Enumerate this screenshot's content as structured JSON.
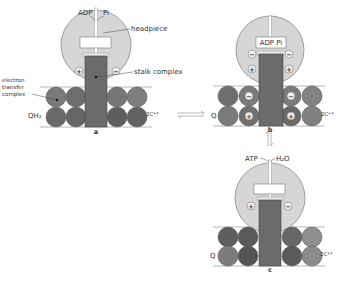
{
  "colors": {
    "headpiece": "#d6d6d6",
    "stalk": "#6b6b6b",
    "sphere_dark": "#5e5e5e",
    "sphere_mid": "#7a7a7a",
    "sphere_light": "#9a9a9a",
    "line": "#9a9a9a"
  },
  "panels": {
    "a": {
      "letter": "a",
      "top_left": "ADP",
      "top_right": "Pi",
      "headpiece_label": "headpiece",
      "stalk_label": "stalk complex",
      "etc_label": "electron transfer complex",
      "etc_lines": [
        "electron",
        "transfer",
        "complex"
      ],
      "left_label": "QH₂",
      "right_label": "2C⁺³",
      "head_signs": [
        "+",
        "−"
      ]
    },
    "b": {
      "letter": "b",
      "box_label": "ADP  Pi",
      "left_label": "Q",
      "right_label": "2C⁺³",
      "head_signs": [
        "−",
        "−",
        "+",
        "+"
      ],
      "sphere_signs": [
        "−",
        "−",
        "+",
        "+"
      ]
    },
    "c": {
      "letter": "c",
      "top_left": "ATP",
      "top_right": "H₂O",
      "left_label": "Q",
      "right_label": "2C⁺³",
      "head_signs": [
        "+",
        "−"
      ]
    }
  },
  "arrows": {
    "horizontal": "reversible equilibrium a ⇌ b",
    "vertical": "reversible equilibrium b ⇌ c"
  }
}
